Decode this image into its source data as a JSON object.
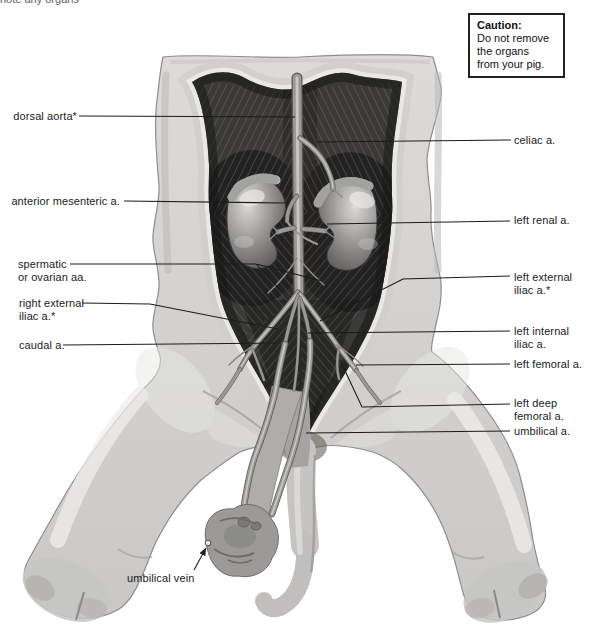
{
  "page": {
    "background": "#ffffff",
    "top_cropped_text": "note any organs"
  },
  "caution": {
    "title": "Caution:",
    "body": "Do not remove\nthe organs\nfrom your pig."
  },
  "labels": {
    "dorsal_aorta": "dorsal aorta*",
    "celiac": "celiac a.",
    "anterior_mesenteric": "anterior mesenteric a.",
    "left_renal": "left renal a.",
    "spermatic_or_ovarian": "spermatic\nor ovarian aa.",
    "left_external_iliac": "left external\niliac a.*",
    "right_external_iliac": "right external\niliac a.*",
    "left_internal_iliac": "left internal\niliac a.",
    "caudal": "caudal a.",
    "left_femoral": "left femoral a.",
    "left_deep_femoral": "left deep\nfemoral a.",
    "umbilical_artery": "umbilical a.",
    "umbilical_vein": "umbilical vein"
  },
  "colors": {
    "label_text": "#1b1b1b",
    "leader_line": "#1c1c1c",
    "caution_border": "#222222",
    "body_gray": "#d3d2d0",
    "cavity_gray": "#3b3a37",
    "page_background": "#ffffff"
  }
}
